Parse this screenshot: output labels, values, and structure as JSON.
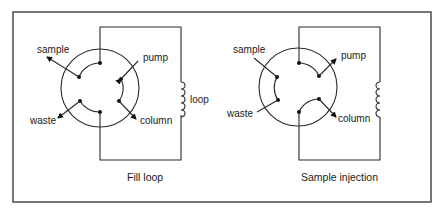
{
  "figure": {
    "panels": [
      {
        "id": "fill-loop",
        "caption": "Fill loop",
        "labels": {
          "sample": "sample",
          "pump": "pump",
          "loop": "loop",
          "waste": "waste",
          "column": "column"
        },
        "connections": [
          [
            "sample",
            "loop-start"
          ],
          [
            "pump",
            "column"
          ],
          [
            "waste",
            "loop-end"
          ]
        ]
      },
      {
        "id": "sample-injection",
        "caption": "Sample injection",
        "labels": {
          "sample": "sample",
          "pump": "pump",
          "waste": "waste",
          "column": "column"
        },
        "connections": [
          [
            "loop-start",
            "pump"
          ],
          [
            "sample",
            "waste"
          ],
          [
            "loop-end",
            "column"
          ]
        ]
      }
    ]
  }
}
